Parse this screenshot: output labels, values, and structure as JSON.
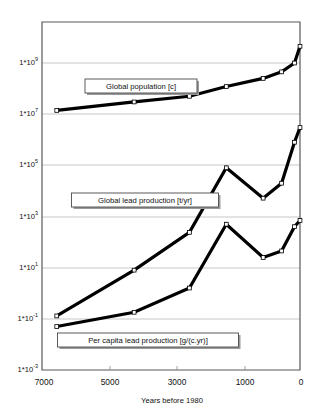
{
  "chart_data": {
    "type": "line",
    "title": "",
    "xlabel": "Years before 1980",
    "ylabel": "",
    "xlim": [
      7000,
      0
    ],
    "ylim": [
      0.001,
      1000000000
    ],
    "yscale": "log",
    "xscale": "linear",
    "grid": true,
    "legend_position": "inline-callouts",
    "xticks": [
      7000,
      5000,
      3000,
      1000,
      0
    ],
    "xtick_labels": [
      "7000",
      "5000",
      "3000",
      "1000",
      "0"
    ],
    "yticks": [
      1000000000,
      10000000,
      100000,
      1000,
      10,
      0.1,
      0.001
    ],
    "ytick_labels": [
      "1*10",
      "1*10",
      "1*10",
      "1*10",
      "1*10",
      "1*10",
      "1*10"
    ],
    "ytick_exponents": [
      "9",
      "7",
      "5",
      "3",
      "1",
      "-1",
      "-3"
    ],
    "series": [
      {
        "name": "Global population [c]",
        "unit": "c",
        "x": [
          6600,
          4500,
          3000,
          2000,
          1000,
          500,
          150,
          0
        ],
        "values": [
          14000000,
          30000000,
          50000000,
          120000000,
          250000000,
          450000000,
          1000000000,
          4500000000
        ]
      },
      {
        "name": "Global lead production [t/yr]",
        "unit": "t/yr",
        "x": [
          6600,
          4500,
          3000,
          2000,
          1000,
          500,
          150,
          0
        ],
        "values": [
          0.13,
          8,
          240,
          80000,
          5200,
          20000,
          800000,
          3000000
        ]
      },
      {
        "name": "Per capita lead production [g/(c.yr)]",
        "unit": "g/(c.yr)",
        "x": [
          6600,
          4500,
          3000,
          2000,
          1000,
          500,
          150,
          0
        ],
        "values": [
          0.05,
          0.18,
          1.6,
          500,
          25,
          45,
          400,
          700
        ]
      }
    ],
    "annotations": [
      {
        "label": "Global population [c]",
        "x_center": 141,
        "y_center": 86
      },
      {
        "label": "Global lead production [t/yr]",
        "x_center": 145,
        "y_center": 200
      },
      {
        "label": "Per capita lead production [g/(c.yr)]",
        "x_center": 148,
        "y_center": 340
      }
    ]
  },
  "axis": {
    "x_title": "Years before 1980"
  }
}
